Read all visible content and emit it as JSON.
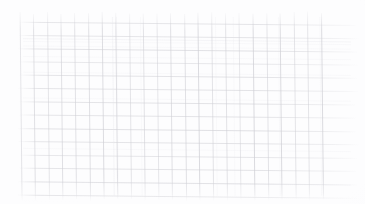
{
  "image": {
    "subject": "graph-paper-grid",
    "description": "Faint scan of blank square-ruled graph paper, slightly skewed",
    "width": 365,
    "height": 204,
    "background_color": "#fdfdfe",
    "has_text": false,
    "has_data_marks": false
  },
  "grid": {
    "line_color": "#d4d4d9",
    "line_color_strong": "#c2c2c8",
    "line_color_faint": "#e7e7ea",
    "line_width": 0.7,
    "skew_degrees": 0.55,
    "vertical": {
      "count": 23,
      "pitch": 13.7,
      "x_start": 20,
      "x_end": 321,
      "y_top": 13,
      "y_bottom": 200
    },
    "horizontal": {
      "count": 14,
      "pitch": 13.3,
      "y_start": 22,
      "y_end": 195,
      "x_left": 19,
      "x_right": 357
    }
  }
}
